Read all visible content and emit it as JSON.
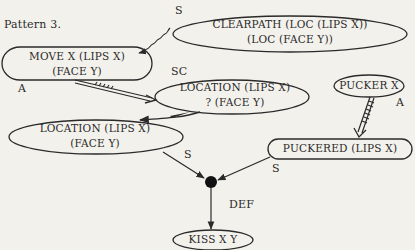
{
  "title": "Pattern 3.",
  "nodes": {
    "clearpath": {
      "line1": "CLEARPATH (LOC (LIPS X))",
      "line2": "(LOC (FACE Y))"
    },
    "move": {
      "line1": "MOVE X (LIPS X)",
      "line2": "(FACE Y)"
    },
    "location_q": {
      "line1": "LOCATION (LIPS X)",
      "line2": "? (FACE Y)"
    },
    "pucker": {
      "line1": "PUCKER X"
    },
    "location": {
      "line1": "LOCATION (LIPS X)",
      "line2": "(FACE Y)"
    },
    "puckered": {
      "line1": "PUCKERED (LIPS X)"
    },
    "kiss": {
      "line1": "KISS X Y"
    }
  },
  "edge_labels": {
    "clearpath_s": "S",
    "move_a": "A",
    "location_q_sc": "SC",
    "pucker_a": "A",
    "location_s": "S",
    "puckered_s": "S",
    "junction_def": "DEF"
  },
  "colors": {
    "background": "#f3f1ec",
    "ink": "#2a2a2a"
  }
}
